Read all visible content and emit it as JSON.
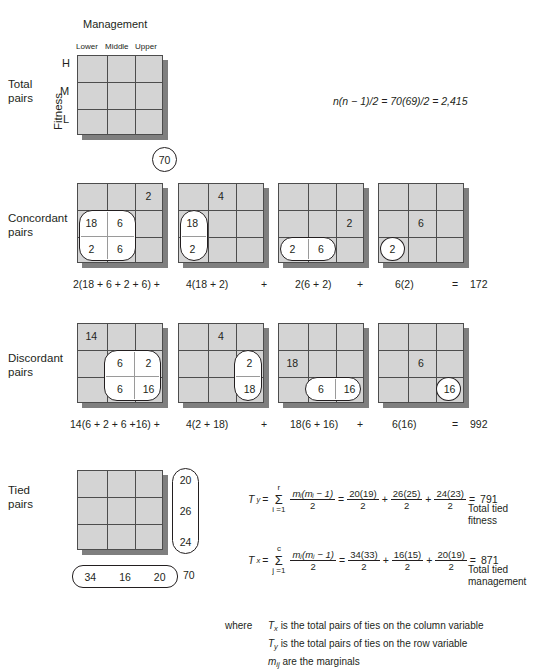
{
  "figure": {
    "column_variable_title": "Management",
    "row_variable_title": "Fitness",
    "column_headers": [
      "Lower",
      "Middle",
      "Upper"
    ],
    "row_headers": [
      "H",
      "M",
      "L"
    ],
    "sample_size_circle": "70",
    "total_pairs_formula": "n(n − 1)/2 = 70(69)/2 = 2,415"
  },
  "sections": {
    "total": {
      "label_line1": "Total",
      "label_line2": "pairs"
    },
    "concordant": {
      "label_line1": "Concordant",
      "label_line2": "pairs"
    },
    "discordant": {
      "label_line1": "Discordant",
      "label_line2": "pairs"
    },
    "tied": {
      "label_line1": "Tied",
      "label_line2": "pairs"
    }
  },
  "concordant": {
    "panels": [
      {
        "multiplier_cell": "2",
        "highlight_cells": [
          "18",
          "6",
          "2",
          "6"
        ],
        "term": "2(18 + 6 + 2 + 6) +"
      },
      {
        "multiplier_cell": "4",
        "highlight_cells": [
          "18",
          "2"
        ],
        "term": "4(18 + 2)"
      },
      {
        "multiplier_cell": "2",
        "highlight_cells": [
          "2",
          "6"
        ],
        "term": "2(6 + 2)"
      },
      {
        "multiplier_cell": "6",
        "highlight_cells": [
          "2"
        ],
        "term": "6(2)"
      }
    ],
    "plus_signs": [
      "+",
      "+"
    ],
    "equals": "=",
    "total": "172"
  },
  "discordant": {
    "panels": [
      {
        "multiplier_cell": "14",
        "highlight_cells": [
          "6",
          "2",
          "6",
          "16"
        ],
        "term": "14(6 + 2 + 6 +16) +"
      },
      {
        "multiplier_cell": "4",
        "highlight_cells": [
          "2",
          "18"
        ],
        "term": "4(2 + 18)"
      },
      {
        "multiplier_cell": "18",
        "highlight_cells": [
          "6",
          "16"
        ],
        "term": "18(6 + 16)"
      },
      {
        "multiplier_cell": "6",
        "highlight_cells": [
          "16"
        ],
        "term": "6(16)"
      }
    ],
    "plus_signs": [
      "+",
      "+"
    ],
    "equals": "=",
    "total": "992"
  },
  "tied": {
    "row_marginals": [
      "20",
      "26",
      "24"
    ],
    "column_marginals": [
      "34",
      "16",
      "20"
    ],
    "grand_total": "70",
    "ty": {
      "symbol": "T",
      "symbol_sub": "y",
      "equals1": "=",
      "sigma_top": "r",
      "sigma_bottom": "i =1",
      "general_num": "mᵢ(mᵢ − 1)",
      "general_den": "2",
      "equals2": "=",
      "terms": [
        {
          "num": "20(19)",
          "den": "2"
        },
        {
          "num": "26(25)",
          "den": "2"
        },
        {
          "num": "24(23)",
          "den": "2"
        }
      ],
      "plus": [
        "+",
        "+"
      ],
      "equals3": "=",
      "result": "791",
      "caption_line1": "Total tied",
      "caption_line2": "fitness"
    },
    "tx": {
      "symbol": "T",
      "symbol_sub": "x",
      "equals1": "=",
      "sigma_top": "c",
      "sigma_bottom": "j =1",
      "general_num": "mⱼ(mⱼ − 1)",
      "general_den": "2",
      "equals2": "=",
      "terms": [
        {
          "num": "34(33)",
          "den": "2"
        },
        {
          "num": "16(15)",
          "den": "2"
        },
        {
          "num": "20(19)",
          "den": "2"
        }
      ],
      "plus": [
        "+",
        "+"
      ],
      "equals3": "=",
      "result": "871",
      "caption_line1": "Total tied",
      "caption_line2": "management"
    }
  },
  "legend": {
    "where": "where",
    "lines": [
      {
        "sym": "T",
        "sub": "x",
        "text": " is the total pairs of ties on the column variable"
      },
      {
        "sym": "T",
        "sub": "y",
        "text": " is the total pairs of ties on the row variable"
      },
      {
        "sym": "m",
        "sub": "ij",
        "text": " are the marginals"
      }
    ]
  }
}
